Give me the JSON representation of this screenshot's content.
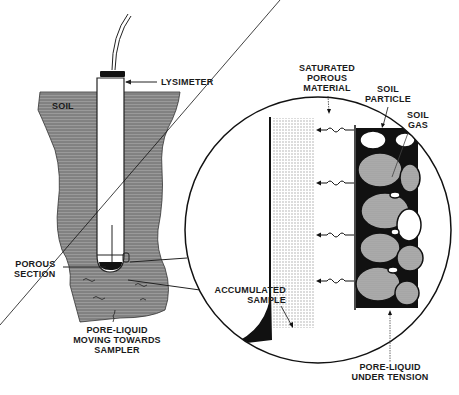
{
  "figure": {
    "colors": {
      "ink": "#1a1a1a",
      "soil": "#8a8a8a",
      "soil_dark": "#5a5a5a",
      "porous_fill": "#c8c8c8",
      "particle_fill": "#a9a9a9",
      "background": "#ffffff"
    },
    "labels": {
      "lysimeter": "LYSIMETER",
      "soil": "SOIL",
      "porous_section": "POROUS\nSECTION",
      "pore_liquid_moving": "PORE-LIQUID\nMOVING TOWARDS\nSAMPLER",
      "saturated_porous_material": "SATURATED\nPOROUS\nMATERIAL",
      "soil_particle": "SOIL\nPARTICLE",
      "soil_gas": "SOIL\nGAS",
      "accumulated_sample": "ACCUMULATED\nSAMPLE",
      "pore_liquid_tension": "PORE-LIQUID\nUNDER TENSION"
    },
    "icons": {
      "flow_arrows": "wavy-arrow-left",
      "magnifier": "detail-circle"
    }
  }
}
